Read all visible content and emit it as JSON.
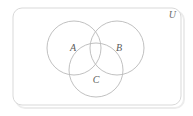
{
  "figure": {
    "kind": "venn-diagram",
    "set_count": 3,
    "background_color": "#ffffff"
  },
  "universe": {
    "label": "U",
    "label_x": 176,
    "label_y": 18,
    "border_color": "#d9d9d9",
    "shadow_color": "#ececec",
    "frame": {
      "x": 13,
      "y": 8,
      "width": 168,
      "height": 97,
      "radius": 9
    }
  },
  "circles": [
    {
      "id": "set-a",
      "label": "A",
      "cx": 74,
      "cy": 48,
      "r": 27,
      "stroke": "#b9b9b9",
      "label_x": 73,
      "label_y": 51
    },
    {
      "id": "set-b",
      "label": "B",
      "cx": 117,
      "cy": 48,
      "r": 27,
      "stroke": "#b9b9b9",
      "label_x": 119,
      "label_y": 51
    },
    {
      "id": "set-c",
      "label": "C",
      "cx": 96,
      "cy": 70,
      "r": 27,
      "stroke": "#b9b9b9",
      "label_x": 96,
      "label_y": 83
    }
  ]
}
